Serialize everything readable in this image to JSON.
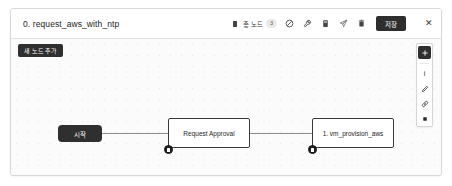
{
  "window": {
    "title": "0. request_aws_with_ntp"
  },
  "header": {
    "node_count_label": "총 노드",
    "node_count_value": "3",
    "icons": [
      {
        "name": "node-stack-icon",
        "glyph": "node-stack"
      },
      {
        "name": "block-circle-icon",
        "glyph": "block-circle"
      },
      {
        "name": "wrench-icon",
        "glyph": "wrench"
      },
      {
        "name": "document-icon",
        "glyph": "document"
      },
      {
        "name": "send-icon",
        "glyph": "send"
      },
      {
        "name": "trash-icon",
        "glyph": "trash"
      }
    ],
    "save_label": "저장",
    "close_label": "✕"
  },
  "canvas": {
    "add_node_label": "새 노드 추가",
    "nodes": [
      {
        "id": "start",
        "label": "시작",
        "type": "start"
      },
      {
        "id": "approval",
        "label": "Request Approval",
        "type": "task"
      },
      {
        "id": "provision",
        "label": "1. vm_provision_aws",
        "type": "task"
      }
    ]
  },
  "side_toolbar": {
    "items": [
      {
        "name": "add-node-icon",
        "label": ""
      },
      {
        "name": "info-icon",
        "label": "i"
      },
      {
        "name": "pencil-icon",
        "label": ""
      },
      {
        "name": "link-icon",
        "label": ""
      },
      {
        "name": "stop-icon",
        "label": ""
      }
    ]
  },
  "colors": {
    "accent_dark": "#2f2f2f",
    "canvas_bg": "#fbfbfb",
    "border": "#d8d8d8"
  }
}
